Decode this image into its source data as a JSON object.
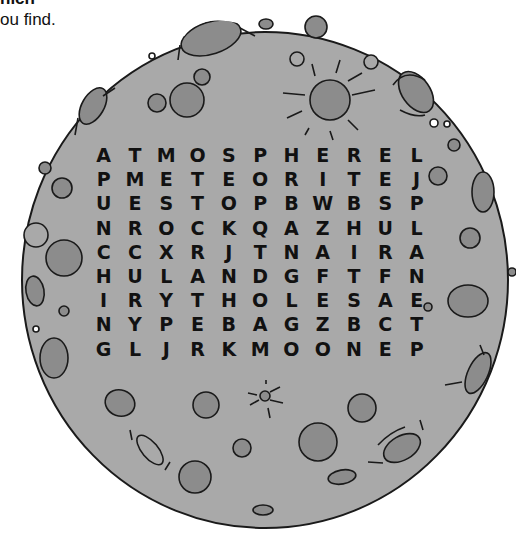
{
  "instructions": {
    "line1": "hich",
    "line2": "ou find."
  },
  "puzzle": {
    "type": "word-search",
    "theme": "moon",
    "rows": 9,
    "cols": 11,
    "grid": [
      [
        "A",
        "T",
        "M",
        "O",
        "S",
        "P",
        "H",
        "E",
        "R",
        "E",
        "L"
      ],
      [
        "P",
        "M",
        "E",
        "T",
        "E",
        "O",
        "R",
        "I",
        "T",
        "E",
        "J"
      ],
      [
        "U",
        "E",
        "S",
        "T",
        "O",
        "P",
        "B",
        "W",
        "B",
        "S",
        "P"
      ],
      [
        "N",
        "R",
        "O",
        "C",
        "K",
        "Q",
        "A",
        "Z",
        "H",
        "U",
        "L"
      ],
      [
        "C",
        "C",
        "X",
        "R",
        "J",
        "T",
        "N",
        "A",
        "I",
        "R",
        "A"
      ],
      [
        "H",
        "U",
        "L",
        "A",
        "N",
        "D",
        "G",
        "F",
        "T",
        "F",
        "N"
      ],
      [
        "I",
        "R",
        "Y",
        "T",
        "H",
        "O",
        "L",
        "E",
        "S",
        "A",
        "E"
      ],
      [
        "N",
        "Y",
        "P",
        "E",
        "B",
        "A",
        "G",
        "Z",
        "B",
        "C",
        "T"
      ],
      [
        "G",
        "L",
        "J",
        "R",
        "K",
        "M",
        "O",
        "O",
        "N",
        "E",
        "P"
      ]
    ]
  },
  "colors": {
    "moon_fill": "#a9a9a9",
    "crater_fill": "#8c8c8c",
    "outline": "#1a1a1a",
    "highlight": "#ffffff",
    "letter": "#111111"
  },
  "decorations": {
    "sun_icon": "sun-burst-crater",
    "small_sun_icon": "small-sun-burst-crater"
  }
}
